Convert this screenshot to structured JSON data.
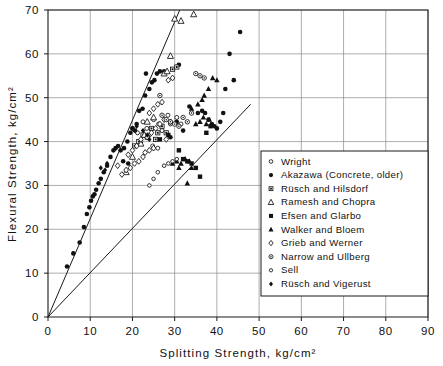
{
  "chart_data": {
    "type": "scatter",
    "title": "",
    "xlabel": "Splitting  Strength,  kg/cm²",
    "ylabel": "Flexural  Strength,  kg/cm²",
    "xlim": [
      0,
      90
    ],
    "ylim": [
      0,
      70
    ],
    "xticks": [
      0,
      10,
      20,
      30,
      40,
      50,
      60,
      70,
      80,
      90
    ],
    "yticks": [
      0,
      10,
      20,
      30,
      40,
      50,
      60,
      70
    ],
    "xtick_labels": [
      "0",
      "10",
      "20",
      "30",
      "40",
      "50",
      "60",
      "70",
      "80",
      "90"
    ],
    "ytick_labels": [
      "0",
      "10",
      "20",
      "30",
      "40",
      "50",
      "60",
      "70"
    ],
    "grid": true,
    "legend_position": "lower-right",
    "annotations": [],
    "reference_lines": [
      {
        "name": "upper-bound-line",
        "from": [
          0,
          0
        ],
        "to": [
          31.2,
          70.0
        ]
      },
      {
        "name": "lower-bound-line",
        "from": [
          0,
          0
        ],
        "to": [
          48.0,
          48.5
        ]
      }
    ],
    "series": [
      {
        "name": "Wright",
        "marker": "small-open-circle",
        "points": [
          [
            20.0,
            43.0
          ],
          [
            21.2,
            42.0
          ],
          [
            22.5,
            44.5
          ],
          [
            23.4,
            43.0
          ],
          [
            24.0,
            41.5
          ],
          [
            25.0,
            45.0
          ],
          [
            26.2,
            44.0
          ],
          [
            27.0,
            42.5
          ],
          [
            28.4,
            46.0
          ],
          [
            29.0,
            44.0
          ],
          [
            30.5,
            45.5
          ],
          [
            31.5,
            44.0
          ],
          [
            24.8,
            39.0
          ],
          [
            26.0,
            38.5
          ],
          [
            22.0,
            40.0
          ]
        ]
      },
      {
        "name": "Akazawa (Concrete, older)",
        "marker": "filled-circle",
        "points": [
          [
            4.5,
            11.5
          ],
          [
            6.0,
            14.5
          ],
          [
            7.5,
            17.0
          ],
          [
            8.5,
            20.5
          ],
          [
            9.2,
            23.5
          ],
          [
            9.8,
            25.0
          ],
          [
            10.2,
            26.5
          ],
          [
            10.6,
            27.5
          ],
          [
            11.0,
            28.0
          ],
          [
            11.4,
            29.0
          ],
          [
            12.0,
            30.5
          ],
          [
            12.5,
            31.5
          ],
          [
            13.2,
            33.0
          ],
          [
            14.0,
            34.5
          ],
          [
            14.8,
            36.5
          ],
          [
            15.5,
            38.0
          ],
          [
            16.0,
            38.5
          ],
          [
            16.6,
            39.0
          ],
          [
            17.2,
            38.0
          ],
          [
            18.0,
            38.5
          ],
          [
            18.8,
            40.0
          ],
          [
            19.5,
            42.0
          ],
          [
            20.0,
            43.0
          ],
          [
            20.6,
            42.5
          ],
          [
            21.0,
            44.0
          ],
          [
            21.6,
            47.0
          ],
          [
            22.4,
            47.5
          ],
          [
            23.0,
            50.5
          ],
          [
            24.0,
            52.0
          ],
          [
            24.6,
            53.5
          ],
          [
            25.2,
            54.0
          ],
          [
            25.8,
            55.5
          ],
          [
            26.5,
            56.0
          ],
          [
            23.2,
            55.5
          ],
          [
            27.5,
            56.0
          ],
          [
            31.0,
            57.5
          ],
          [
            33.5,
            48.0
          ],
          [
            35.5,
            46.5
          ],
          [
            36.5,
            47.0
          ],
          [
            37.2,
            46.5
          ],
          [
            38.0,
            45.0
          ],
          [
            38.8,
            44.0
          ],
          [
            39.4,
            43.5
          ],
          [
            40.0,
            43.0
          ],
          [
            40.8,
            44.5
          ],
          [
            41.5,
            46.5
          ],
          [
            44.0,
            54.0
          ],
          [
            45.5,
            65.0
          ],
          [
            43.0,
            60.0
          ],
          [
            42.0,
            52.0
          ],
          [
            30.5,
            44.5
          ],
          [
            32.0,
            42.5
          ],
          [
            29.0,
            41.0
          ],
          [
            17.8,
            35.5
          ],
          [
            19.0,
            35.0
          ]
        ]
      },
      {
        "name": "Rüsch and Hilsdorf",
        "marker": "filled-square-small",
        "points": [
          [
            22.5,
            41.5
          ],
          [
            23.5,
            41.0
          ],
          [
            24.5,
            43.0
          ],
          [
            26.0,
            42.0
          ],
          [
            27.0,
            43.5
          ],
          [
            28.0,
            42.0
          ],
          [
            21.5,
            40.0
          ],
          [
            25.5,
            40.5
          ],
          [
            29.5,
            56.5
          ],
          [
            30.5,
            57.0
          ],
          [
            20.5,
            39.0
          ]
        ]
      },
      {
        "name": "Ramesh and Chopra",
        "marker": "open-triangle",
        "points": [
          [
            18.5,
            33.0
          ],
          [
            20.0,
            36.5
          ],
          [
            22.0,
            39.5
          ],
          [
            22.8,
            41.5
          ],
          [
            23.5,
            44.5
          ],
          [
            25.0,
            45.5
          ],
          [
            27.5,
            55.5
          ],
          [
            28.2,
            56.0
          ],
          [
            29.0,
            59.5
          ],
          [
            30.0,
            68.0
          ],
          [
            31.5,
            67.5
          ],
          [
            34.5,
            69.0
          ]
        ]
      },
      {
        "name": "Efsen and Glarbo",
        "marker": "filled-square",
        "points": [
          [
            26.5,
            40.5
          ],
          [
            28.5,
            41.5
          ],
          [
            31.0,
            38.0
          ],
          [
            33.0,
            35.5
          ],
          [
            34.0,
            35.0
          ],
          [
            36.0,
            32.0
          ],
          [
            37.5,
            42.0
          ],
          [
            38.5,
            43.5
          ],
          [
            32.0,
            36.0
          ],
          [
            35.0,
            34.0
          ]
        ]
      },
      {
        "name": "Walker and Bloem",
        "marker": "filled-triangle",
        "points": [
          [
            30.5,
            35.5
          ],
          [
            31.5,
            35.0
          ],
          [
            32.5,
            36.0
          ],
          [
            33.5,
            35.5
          ],
          [
            34.0,
            34.0
          ],
          [
            33.0,
            30.5
          ],
          [
            35.0,
            44.0
          ],
          [
            36.0,
            44.5
          ],
          [
            36.8,
            45.5
          ],
          [
            37.5,
            44.0
          ],
          [
            38.2,
            45.0
          ],
          [
            35.5,
            48.5
          ],
          [
            36.5,
            49.5
          ],
          [
            37.0,
            50.5
          ],
          [
            38.0,
            52.0
          ],
          [
            39.0,
            54.5
          ],
          [
            40.0,
            54.0
          ],
          [
            34.0,
            47.5
          ],
          [
            31.0,
            34.0
          ],
          [
            29.5,
            35.0
          ]
        ]
      },
      {
        "name": "Grieb and Werner",
        "marker": "open-diamond",
        "points": [
          [
            17.5,
            32.5
          ],
          [
            18.5,
            33.5
          ],
          [
            19.5,
            34.0
          ],
          [
            20.5,
            35.0
          ],
          [
            21.5,
            35.5
          ],
          [
            22.5,
            36.5
          ],
          [
            23.0,
            37.5
          ],
          [
            24.0,
            38.0
          ],
          [
            25.0,
            38.5
          ],
          [
            21.0,
            39.0
          ],
          [
            22.0,
            40.5
          ],
          [
            23.5,
            41.0
          ],
          [
            24.5,
            42.0
          ],
          [
            25.5,
            43.0
          ],
          [
            26.5,
            44.0
          ],
          [
            27.5,
            45.0
          ],
          [
            24.0,
            46.5
          ],
          [
            25.0,
            47.5
          ],
          [
            26.0,
            48.5
          ],
          [
            27.0,
            49.0
          ],
          [
            28.5,
            54.0
          ],
          [
            29.5,
            54.5
          ],
          [
            19.0,
            37.0
          ],
          [
            20.0,
            38.0
          ],
          [
            16.5,
            34.5
          ],
          [
            28.0,
            40.5
          ],
          [
            29.0,
            44.5
          ]
        ]
      },
      {
        "name": "Narrow and Ullberg",
        "marker": "small-open-circle-dot",
        "points": [
          [
            28.0,
            45.0
          ],
          [
            29.0,
            44.5
          ],
          [
            30.0,
            44.0
          ],
          [
            31.0,
            43.5
          ],
          [
            32.0,
            45.5
          ],
          [
            27.0,
            46.0
          ],
          [
            33.0,
            44.5
          ],
          [
            34.0,
            46.5
          ],
          [
            26.5,
            50.5
          ],
          [
            35.0,
            55.5
          ],
          [
            36.0,
            55.0
          ],
          [
            37.0,
            54.5
          ]
        ]
      },
      {
        "name": "Sell",
        "marker": "tiny-open-circle",
        "points": [
          [
            26.0,
            33.0
          ],
          [
            27.5,
            34.5
          ],
          [
            28.5,
            35.0
          ],
          [
            29.5,
            35.5
          ],
          [
            30.5,
            36.0
          ],
          [
            25.0,
            31.5
          ],
          [
            24.0,
            30.0
          ]
        ]
      },
      {
        "name": "Rüsch and Vigerust",
        "marker": "filled-diamond",
        "points": [
          [
            12.5,
            34.0
          ],
          [
            13.5,
            33.5
          ],
          [
            22.5,
            42.5
          ],
          [
            23.5,
            41.5
          ],
          [
            24.0,
            40.5
          ],
          [
            14.0,
            35.0
          ],
          [
            21.0,
            43.5
          ]
        ]
      }
    ]
  },
  "legend": {
    "entries": [
      {
        "label": "Wright",
        "marker": "small-open-circle"
      },
      {
        "label": "Akazawa (Concrete, older)",
        "marker": "filled-circle"
      },
      {
        "label": "Rüsch  and  Hilsdorf",
        "marker": "filled-square-small"
      },
      {
        "label": "Ramesh  and   Chopra",
        "marker": "open-triangle"
      },
      {
        "label": "Efsen  and    Glarbo",
        "marker": "filled-square"
      },
      {
        "label": "Walker  and   Bloem",
        "marker": "filled-triangle"
      },
      {
        "label": "Grieb  and   Werner",
        "marker": "open-diamond"
      },
      {
        "label": "Narrow  and  Ullberg",
        "marker": "small-open-circle-dot"
      },
      {
        "label": "Sell",
        "marker": "tiny-open-circle"
      },
      {
        "label": "Rüsch  and  Vigerust",
        "marker": "filled-diamond"
      }
    ]
  },
  "colors": {
    "ink": "#111111",
    "grid": "#8a8a8a",
    "background": "#ffffff"
  }
}
